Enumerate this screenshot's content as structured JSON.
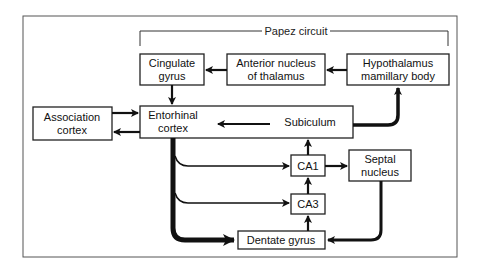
{
  "diagram": {
    "title": "Papez circuit",
    "nodes": {
      "cingulate": {
        "line1": "Cingulate",
        "line2": "gyrus"
      },
      "anterior": {
        "line1": "Anterior nucleus",
        "line2": "of thalamus"
      },
      "hypothalamus": {
        "line1": "Hypothalamus",
        "line2": "mamillary body"
      },
      "association": {
        "line1": "Association",
        "line2": "cortex"
      },
      "entorhinal": {
        "line1": "Entorhinal",
        "line2": "cortex"
      },
      "subiculum": {
        "line1": "Subiculum"
      },
      "ca1": {
        "line1": "CA1"
      },
      "ca3": {
        "line1": "CA3"
      },
      "septal": {
        "line1": "Septal",
        "line2": "nucleus"
      },
      "dentate": {
        "line1": "Dentate gyrus"
      }
    },
    "edges": [
      {
        "from": "Hypothalamus mamillary body",
        "to": "Anterior nucleus of thalamus"
      },
      {
        "from": "Anterior nucleus of thalamus",
        "to": "Cingulate gyrus"
      },
      {
        "from": "Cingulate gyrus",
        "to": "Entorhinal cortex"
      },
      {
        "from": "Association cortex",
        "to": "Entorhinal cortex"
      },
      {
        "from": "Entorhinal cortex",
        "to": "Association cortex"
      },
      {
        "from": "Subiculum",
        "to": "Entorhinal cortex"
      },
      {
        "from": "Subiculum",
        "to": "Hypothalamus mamillary body"
      },
      {
        "from": "Entorhinal cortex",
        "to": "CA1"
      },
      {
        "from": "Entorhinal cortex",
        "to": "CA3"
      },
      {
        "from": "Entorhinal cortex",
        "to": "Dentate gyrus"
      },
      {
        "from": "CA1",
        "to": "Subiculum"
      },
      {
        "from": "CA1",
        "to": "Septal nucleus"
      },
      {
        "from": "CA3",
        "to": "CA1"
      },
      {
        "from": "Dentate gyrus",
        "to": "CA3"
      },
      {
        "from": "Septal nucleus",
        "to": "Dentate gyrus"
      }
    ]
  }
}
